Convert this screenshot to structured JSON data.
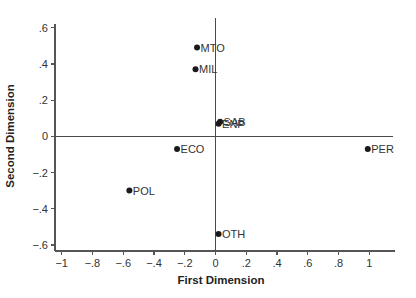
{
  "chart_data": {
    "type": "scatter",
    "title": "",
    "xlabel": "First Dimension",
    "ylabel": "Second Dimension",
    "xlim": [
      -1.0,
      1.15
    ],
    "ylim": [
      -0.64,
      0.65
    ],
    "x_ticks": [
      -1,
      -0.8,
      -0.6,
      -0.4,
      -0.2,
      0,
      0.2,
      0.4,
      0.6,
      0.8,
      1
    ],
    "x_tick_labels": [
      "−1",
      "−.8",
      "−.6",
      "−.4",
      "−.2",
      "0",
      ".2",
      ".4",
      ".6",
      ".8",
      "1"
    ],
    "y_ticks": [
      0.6,
      0.4,
      0.2,
      0,
      -0.2,
      -0.4,
      -0.6
    ],
    "y_tick_labels": [
      ".6",
      ".4",
      ".2",
      "0",
      "−.2",
      "−.4",
      "−.6"
    ],
    "reference_lines": {
      "x": 0,
      "y": 0
    },
    "grid": false,
    "legend": "none",
    "points": [
      {
        "label": "MTO",
        "x": -0.12,
        "y": 0.49
      },
      {
        "label": "MIL",
        "x": -0.13,
        "y": 0.37
      },
      {
        "label": "SAB",
        "x": 0.03,
        "y": 0.08
      },
      {
        "label": "ENP",
        "x": 0.02,
        "y": 0.07
      },
      {
        "label": "ECO",
        "x": -0.25,
        "y": -0.07
      },
      {
        "label": "PER",
        "x": 0.99,
        "y": -0.07
      },
      {
        "label": "POL",
        "x": -0.56,
        "y": -0.3
      },
      {
        "label": "OTH",
        "x": 0.02,
        "y": -0.54
      }
    ]
  }
}
